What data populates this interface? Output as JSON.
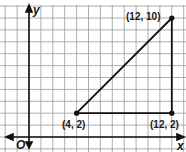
{
  "chart_data": {
    "type": "scatter",
    "title": "",
    "xlabel": "x",
    "ylabel": "y",
    "origin_label": "O",
    "grid": true,
    "xlim": [
      -2,
      13
    ],
    "ylim": [
      -1,
      11
    ],
    "points": [
      {
        "label": "(4, 2)",
        "x": 4,
        "y": 2
      },
      {
        "label": "(12, 10)",
        "x": 12,
        "y": 10
      },
      {
        "label": "(12, 2)",
        "x": 12,
        "y": 2
      }
    ],
    "segments": [
      {
        "from": [
          4,
          2
        ],
        "to": [
          12,
          10
        ]
      },
      {
        "from": [
          4,
          2
        ],
        "to": [
          12,
          2
        ]
      },
      {
        "from": [
          12,
          2
        ],
        "to": [
          12,
          10
        ]
      }
    ]
  },
  "labels": {
    "x_axis": "x",
    "y_axis": "y",
    "origin": "O",
    "p1": "(4, 2)",
    "p2": "(12, 10)",
    "p3": "(12, 2)"
  }
}
